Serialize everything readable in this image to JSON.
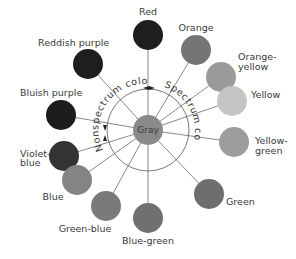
{
  "diagram": {
    "center": {
      "label": "Gray",
      "color": "#8a8a8a"
    },
    "arc_labels": {
      "nonspectrum": "Nonspectrum colors",
      "spectrum": "Spectrum colors"
    },
    "colors": [
      {
        "label": "Red",
        "label2": "",
        "fill": "#1e1e1e"
      },
      {
        "label": "Orange",
        "label2": "",
        "fill": "#757575"
      },
      {
        "label": "Orange-",
        "label2": "yellow",
        "fill": "#9a9a9a"
      },
      {
        "label": "Yellow",
        "label2": "",
        "fill": "#c4c4c4"
      },
      {
        "label": "Yellow-",
        "label2": "green",
        "fill": "#9d9d9d"
      },
      {
        "label": "Green",
        "label2": "",
        "fill": "#6e6e6e"
      },
      {
        "label": "Blue-green",
        "label2": "",
        "fill": "#707070"
      },
      {
        "label": "Green-blue",
        "label2": "",
        "fill": "#7a7a7a"
      },
      {
        "label": "Blue",
        "label2": "",
        "fill": "#848484"
      },
      {
        "label": "Violet-",
        "label2": "blue",
        "fill": "#333333"
      },
      {
        "label": "Bluish purple",
        "label2": "",
        "fill": "#1c1c1c"
      },
      {
        "label": "Reddish purple",
        "label2": "",
        "fill": "#1e1e1e"
      }
    ]
  }
}
